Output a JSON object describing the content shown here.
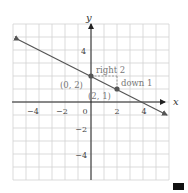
{
  "chart_data": {
    "type": "line",
    "title": "",
    "xlabel": "x",
    "ylabel": "y",
    "xlim": [
      -6,
      6
    ],
    "ylim": [
      -6,
      6
    ],
    "grid": true,
    "x_ticks": [
      -4,
      -2,
      0,
      2,
      4
    ],
    "y_ticks": [
      4,
      -2,
      -4
    ],
    "x_tick_labels": [
      "−4",
      "−2",
      "0",
      "2",
      "4"
    ],
    "y_tick_labels": [
      "4",
      "−2",
      "−4"
    ],
    "series": [
      {
        "name": "y = -1/2 x + 2",
        "slope": -0.5,
        "intercept": 2,
        "x": [
          -5.5,
          5.5
        ],
        "y": [
          4.75,
          -0.75
        ],
        "arrows": "both"
      }
    ],
    "points": [
      {
        "x": 0,
        "y": 2,
        "label": "(0, 2)"
      },
      {
        "x": 2,
        "y": 1,
        "label": "(2, 1)"
      }
    ],
    "annotations": [
      {
        "text": "right 2",
        "from": [
          0,
          2
        ],
        "to": [
          2,
          2
        ]
      },
      {
        "text": "down 1",
        "from": [
          2,
          2
        ],
        "to": [
          2,
          1
        ]
      }
    ]
  },
  "labels": {
    "x_axis": "x",
    "y_axis": "y",
    "point_a": "(0, 2)",
    "point_b": "(2, 1)",
    "right": "right 2",
    "down": "down 1",
    "tick_x_m4": "−4",
    "tick_x_m2": "−2",
    "tick_x_0": "0",
    "tick_x_2": "2",
    "tick_x_4": "4",
    "tick_y_4": "4",
    "tick_y_m2": "−2",
    "tick_y_m4": "−4"
  },
  "colors": {
    "grid": "#d0d0d0",
    "axis": "#222222",
    "line": "#555555",
    "point": "#555555",
    "annotation": "#777777"
  }
}
